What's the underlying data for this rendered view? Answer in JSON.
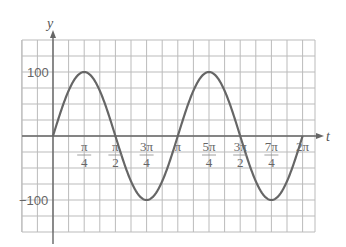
{
  "chart_data": {
    "type": "line",
    "title": "",
    "xlabel": "t",
    "ylabel": "y",
    "function": "y = 100 sin(2t)",
    "xlim": [
      -0.7854,
      2.5
    ],
    "ylim": [
      -150,
      150
    ],
    "grid": true,
    "x_tick_labels": [
      {
        "num": "π",
        "den": "4",
        "value": 0.7854
      },
      {
        "num": "π",
        "den": "2",
        "value": 1.5708
      },
      {
        "num": "3π",
        "den": "4",
        "value": 2.3562
      },
      {
        "num": "π",
        "den": "",
        "value": 3.1416
      },
      {
        "num": "5π",
        "den": "4",
        "value": 3.927
      },
      {
        "num": "3π",
        "den": "2",
        "value": 4.7124
      },
      {
        "num": "7π",
        "den": "4",
        "value": 5.4978
      },
      {
        "num": "2π",
        "den": "",
        "value": 6.2832
      }
    ],
    "y_tick_labels": [
      {
        "label": "100",
        "value": 100
      },
      {
        "label": "-100",
        "value": -100
      }
    ],
    "series": [
      {
        "name": "y = 100 sin(2t)",
        "x": [
          0,
          0.3927,
          0.7854,
          1.1781,
          1.5708,
          1.9635,
          2.3562,
          2.7489,
          3.1416,
          3.5343,
          3.927,
          4.3197,
          4.7124,
          5.1051,
          5.4978,
          5.8905,
          6.2832
        ],
        "values": [
          0,
          70.7,
          100,
          70.7,
          0,
          -70.7,
          -100,
          -70.7,
          0,
          70.7,
          100,
          70.7,
          0,
          -70.7,
          -100,
          -70.7,
          0
        ]
      }
    ]
  },
  "labels": {
    "y_axis": "y",
    "t_axis": "t",
    "y100": "100",
    "yneg100": "−100"
  }
}
